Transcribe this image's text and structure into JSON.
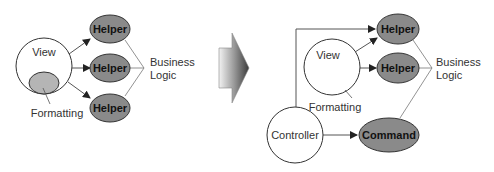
{
  "colors": {
    "node_fill": "#8a8a8a",
    "formatting_fill": "#b5b5b5",
    "stroke": "#333333",
    "line": "#555555"
  },
  "before": {
    "view_label": "View",
    "formatting_label": "Formatting",
    "helpers": [
      "Helper",
      "Helper",
      "Helper"
    ],
    "business_logic": [
      "Business",
      "Logic"
    ]
  },
  "transition_arrow": "right-arrow-icon",
  "after": {
    "view_label": "View",
    "formatting_label": "Formatting",
    "helpers": [
      "Helper",
      "Helper"
    ],
    "controller_label": "Controller",
    "command_label": "Command",
    "business_logic": [
      "Business",
      "Logic"
    ]
  }
}
